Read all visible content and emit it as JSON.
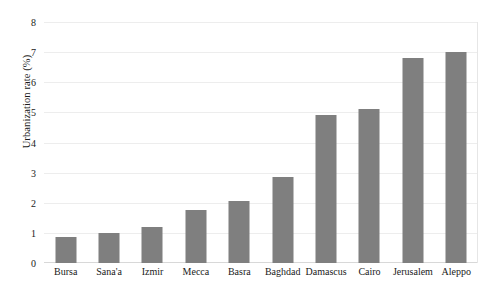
{
  "chart_data": {
    "type": "bar",
    "title": "",
    "subtitle": "",
    "xlabel": "",
    "ylabel": "Urbanization rate (%)",
    "categories": [
      "Bursa",
      "Sana'a",
      "Izmir",
      "Mecca",
      "Basra",
      "Baghdad",
      "Damascus",
      "Cairo",
      "Jerusalem",
      "Aleppo"
    ],
    "values": [
      0.85,
      1.0,
      1.2,
      1.75,
      2.05,
      2.85,
      4.9,
      5.1,
      6.8,
      7.0
    ],
    "series": [
      {
        "name": "Urbanization rate (%)",
        "values": [
          0.85,
          1.0,
          1.2,
          1.75,
          2.05,
          2.85,
          4.9,
          5.1,
          6.8,
          7.0
        ]
      }
    ],
    "ylim": [
      0,
      8
    ],
    "ytick_labels": [
      "0",
      "1",
      "2",
      "3",
      "4",
      "5",
      "6",
      "7",
      "8"
    ],
    "ytick_values": [
      0,
      1,
      2,
      3,
      4,
      5,
      6,
      7,
      8
    ],
    "grid": true,
    "legend": false,
    "legend_position": "none",
    "bar_color": "#7f7f7f",
    "gridline_color": "#ededed",
    "background_color": "#ffffff",
    "annotations": []
  }
}
